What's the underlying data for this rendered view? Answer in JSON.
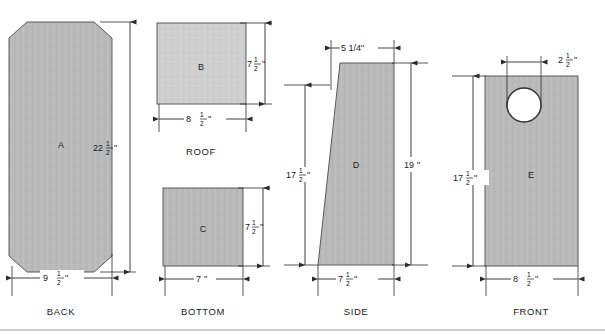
{
  "drawing": {
    "title": "Birdhouse cutting diagram",
    "units": "inches",
    "colors": {
      "fill_dark": "#b9b9b9",
      "fill_light": "#cfcfcf",
      "outline": "#4a4a4a",
      "dimension": "#2b2b2b",
      "text": "#1a1a1a",
      "background": "#ffffff",
      "footer_rule": "#9a9a9a"
    },
    "parts": [
      {
        "id": "back",
        "letter": "A",
        "view_label": "BACK",
        "shape": "octagon",
        "dims": [
          {
            "name": "height",
            "text_whole": "22",
            "text_frac_num": "1",
            "text_frac_den": "2",
            "text_unit": "\"",
            "full": "22 1/2\"",
            "orientation": "vertical"
          },
          {
            "name": "width",
            "text_whole": "9",
            "text_frac_num": "1",
            "text_frac_den": "2",
            "text_unit": "\"",
            "full": "9 1/2\"",
            "orientation": "horizontal"
          }
        ]
      },
      {
        "id": "roof",
        "letter": "B",
        "view_label": "ROOF",
        "shape": "rectangle",
        "dims": [
          {
            "name": "height",
            "text_whole": "7",
            "text_frac_num": "1",
            "text_frac_den": "2",
            "text_unit": "\"",
            "full": "7 1/2\"",
            "orientation": "vertical"
          },
          {
            "name": "width",
            "text_whole": "8",
            "text_frac_num": "1",
            "text_frac_den": "2",
            "text_unit": "\"",
            "full": "8 1/2\"",
            "orientation": "horizontal"
          }
        ]
      },
      {
        "id": "bottom",
        "letter": "C",
        "view_label": "BOTTOM",
        "shape": "rectangle",
        "dims": [
          {
            "name": "height",
            "text_whole": "7",
            "text_frac_num": "1",
            "text_frac_den": "2",
            "text_unit": "\"",
            "full": "7 1/2\"",
            "orientation": "vertical"
          },
          {
            "name": "width",
            "text_whole": "7",
            "text_frac_num": "",
            "text_frac_den": "",
            "text_unit": "\"",
            "full": "7\"",
            "orientation": "horizontal"
          }
        ]
      },
      {
        "id": "side",
        "letter": "D",
        "view_label": "SIDE",
        "shape": "trapezoid",
        "dims": [
          {
            "name": "top-width",
            "full": "5 1/4\"",
            "orientation": "horizontal"
          },
          {
            "name": "left-height",
            "text_whole": "17",
            "text_frac_num": "1",
            "text_frac_den": "2",
            "text_unit": "\"",
            "full": "17 1/2\"",
            "orientation": "vertical"
          },
          {
            "name": "right-height",
            "text_whole": "19",
            "text_frac_num": "",
            "text_frac_den": "",
            "text_unit": "\"",
            "full": "19\"",
            "orientation": "vertical"
          },
          {
            "name": "bottom-width",
            "text_whole": "7",
            "text_frac_num": "1",
            "text_frac_den": "2",
            "text_unit": "\"",
            "full": "7 1/2\"",
            "orientation": "horizontal"
          }
        ]
      },
      {
        "id": "front",
        "letter": "E",
        "view_label": "FRONT",
        "shape": "rectangle-with-hole",
        "dims": [
          {
            "name": "hole-diameter",
            "text_whole": "2",
            "text_frac_num": "1",
            "text_frac_den": "2",
            "text_unit": "\"",
            "full": "2 1/2\"",
            "orientation": "horizontal"
          },
          {
            "name": "height",
            "text_whole": "17",
            "text_frac_num": "1",
            "text_frac_den": "2",
            "text_unit": "\"",
            "full": "17 1/2\"",
            "orientation": "vertical"
          },
          {
            "name": "width",
            "text_whole": "8",
            "text_frac_num": "1",
            "text_frac_den": "2",
            "text_unit": "\"",
            "full": "8 1/2\"",
            "orientation": "horizontal"
          }
        ]
      }
    ]
  }
}
